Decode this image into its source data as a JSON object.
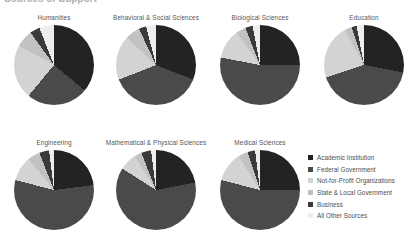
{
  "figure": {
    "cut_title": "Sources of Support",
    "type": "pie-grid"
  },
  "legend": {
    "name": "source-of-support-legend",
    "items": [
      {
        "label": "Academic Institution",
        "color": "#232323",
        "key": "academic"
      },
      {
        "label": "Federal Government",
        "color": "#4a4a4a",
        "key": "federal"
      },
      {
        "label": "Not-for-Profit Organizations",
        "color": "#d3d3d3",
        "key": "nonprofit"
      },
      {
        "label": "State & Local Government",
        "color": "#c2c2c2",
        "key": "state_local"
      },
      {
        "label": "Business",
        "color": "#3a3a3a",
        "key": "business"
      },
      {
        "label": "All Other Sources",
        "color": "#ededed",
        "key": "other"
      }
    ]
  },
  "chart_data": {
    "type": "pie",
    "title": "Sources of Support",
    "legend_position": "bottom-right",
    "categories": [
      "Academic Institution",
      "Federal Government",
      "Not-for-Profit Organizations",
      "State & Local Government",
      "Business",
      "All Other Sources"
    ],
    "colors": [
      "#232323",
      "#4a4a4a",
      "#d3d3d3",
      "#c2c2c2",
      "#3a3a3a",
      "#ededed"
    ],
    "units": "percent",
    "charts": [
      {
        "title": "Humanities",
        "values": [
          36,
          25,
          22,
          7,
          4,
          6
        ],
        "row": 0,
        "col": 0
      },
      {
        "title": "Behavioral & Social Sciences",
        "values": [
          31,
          38,
          18,
          6,
          3,
          4
        ],
        "row": 0,
        "col": 1
      },
      {
        "title": "Biological Sciences",
        "values": [
          25,
          53,
          12,
          4,
          3,
          3
        ],
        "row": 0,
        "col": 2
      },
      {
        "title": "Education",
        "values": [
          28,
          42,
          22,
          3,
          2,
          3
        ],
        "row": 0,
        "col": 3
      },
      {
        "title": "Engineering",
        "values": [
          23,
          56,
          10,
          5,
          4,
          2
        ],
        "row": 1,
        "col": 0
      },
      {
        "title": "Mathematical & Physical Sciences",
        "values": [
          22,
          62,
          7,
          3,
          4,
          2
        ],
        "row": 1,
        "col": 1
      },
      {
        "title": "Medical Sciences",
        "values": [
          25,
          54,
          12,
          4,
          3,
          2
        ],
        "row": 1,
        "col": 2
      }
    ]
  }
}
